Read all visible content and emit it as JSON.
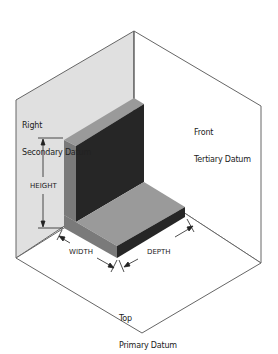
{
  "diagram": {
    "planes": {
      "right": {
        "line1": "Right",
        "line2": "Secondary Datum",
        "fill": "#e0e0e0"
      },
      "front": {
        "line1": "Front",
        "line2": "Tertiary Datum",
        "fill": "#ffffff"
      },
      "top": {
        "line1": "Top",
        "line2": "Primary Datum",
        "fill": "#ffffff"
      }
    },
    "dimensions": {
      "height": "HEIGHT",
      "width": "WIDTH",
      "depth": "DEPTH"
    },
    "part_colors": {
      "top_faces": "#9a9a9a",
      "left_faces": "#7a7a7a",
      "front_faces": "#262626",
      "edge": "#555555"
    }
  }
}
